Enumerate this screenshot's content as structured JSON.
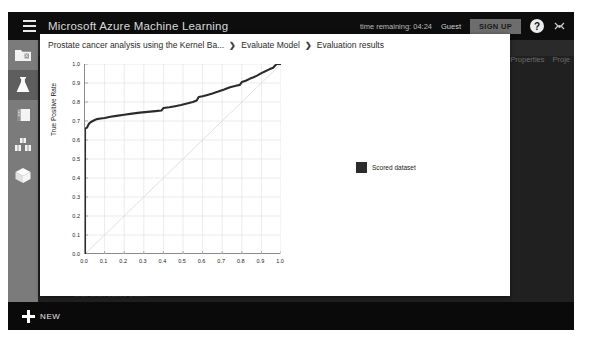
{
  "header": {
    "menu_icon": "hamburger-menu-icon",
    "brand": "Microsoft Azure Machine Learning",
    "time_remaining": "time remaining: 04:24",
    "guest_label": "Guest",
    "signup_label": "SIGN UP",
    "help_icon": "?",
    "feedback_icon": "feedback-smiley-icon"
  },
  "rail": {
    "items": [
      {
        "name": "projects",
        "icon": "folder-projects-icon",
        "active": false
      },
      {
        "name": "experiments",
        "icon": "flask-experiment-icon",
        "active": true
      },
      {
        "name": "datasets",
        "icon": "dataset-book-icon",
        "active": false
      },
      {
        "name": "trained-models",
        "icon": "trained-models-boxes-icon",
        "active": false
      },
      {
        "name": "settings",
        "icon": "cube-package-icon",
        "active": false
      }
    ]
  },
  "background": {
    "collapse_chevron": "❮",
    "experiment_title": "Prostate cancer analysis using the K",
    "search_placeholder": "Search",
    "right_tabs": [
      "Properties",
      "Proje"
    ],
    "tree_nodes": [
      "Saved Datasets",
      "Trained Models"
    ],
    "bottom_note": "Click Chart Labels Shown"
  },
  "dialog": {
    "breadcrumb": [
      "Prostate cancer analysis using the Kernel Ba...",
      "Evaluate Model",
      "Evaluation results"
    ],
    "breadcrumb_separator": "❯"
  },
  "bottombar": {
    "new_label": "NEW",
    "new_icon": "plus-icon"
  },
  "chart_data": {
    "type": "line",
    "title": "",
    "xlabel": "",
    "ylabel": "True Positive Rate",
    "xlim": [
      0.0,
      1.0
    ],
    "ylim": [
      0.0,
      1.0
    ],
    "grid": true,
    "legend_position": "right",
    "xticks": [
      "0.0",
      "0.1",
      "0.2",
      "0.3",
      "0.4",
      "0.5",
      "0.6",
      "0.7",
      "0.8",
      "0.9",
      "1.0"
    ],
    "yticks": [
      "0.0",
      "0.1",
      "0.2",
      "0.3",
      "0.4",
      "0.5",
      "0.6",
      "0.7",
      "0.8",
      "0.9",
      "1.0"
    ],
    "series": [
      {
        "name": "Scored dataset",
        "color": "#2b2b2b",
        "x": [
          0.0,
          0.0,
          0.01,
          0.015,
          0.02,
          0.03,
          0.04,
          0.05,
          0.06,
          0.08,
          0.1,
          0.13,
          0.16,
          0.2,
          0.24,
          0.28,
          0.32,
          0.36,
          0.39,
          0.4,
          0.43,
          0.46,
          0.49,
          0.52,
          0.55,
          0.57,
          0.58,
          0.6,
          0.62,
          0.65,
          0.68,
          0.71,
          0.74,
          0.77,
          0.79,
          0.8,
          0.82,
          0.84,
          0.86,
          0.88,
          0.9,
          0.92,
          0.94,
          0.96,
          0.97,
          0.98,
          1.0
        ],
        "y": [
          0.0,
          0.66,
          0.665,
          0.675,
          0.685,
          0.695,
          0.7,
          0.705,
          0.71,
          0.713,
          0.716,
          0.722,
          0.727,
          0.733,
          0.739,
          0.744,
          0.748,
          0.752,
          0.755,
          0.768,
          0.772,
          0.778,
          0.784,
          0.792,
          0.8,
          0.808,
          0.826,
          0.83,
          0.836,
          0.845,
          0.855,
          0.866,
          0.878,
          0.886,
          0.89,
          0.905,
          0.912,
          0.922,
          0.93,
          0.94,
          0.952,
          0.962,
          0.972,
          0.98,
          0.992,
          1.0,
          1.0
        ]
      },
      {
        "name": "random-baseline-diagonal",
        "color": "#e0dcd4",
        "x": [
          0.0,
          1.0
        ],
        "y": [
          0.0,
          1.0
        ]
      }
    ],
    "legend": [
      {
        "label": "Scored dataset",
        "color": "#2b2b2b"
      }
    ]
  }
}
